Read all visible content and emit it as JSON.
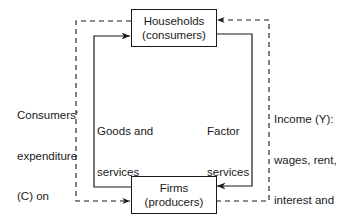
{
  "diagram": {
    "nodes": {
      "households": {
        "line1": "Households",
        "line2": "(consumers)"
      },
      "firms": {
        "line1": "Firms",
        "line2": "(producers)"
      }
    },
    "flows": {
      "goods": {
        "line1": "Goods and",
        "line2": "services",
        "direction": "firms-to-households",
        "style": "solid"
      },
      "factor": {
        "line1": "Factor",
        "line2": "services",
        "direction": "households-to-firms",
        "style": "solid"
      },
      "expenditure": {
        "line1": "Consumers'",
        "line2": "expenditure",
        "line3": "(C) on",
        "line4": "goods and",
        "line5": "services",
        "direction": "households-to-firms",
        "style": "dashed"
      },
      "income": {
        "line1": "Income (Y):",
        "line2": "wages, rent,",
        "line3": "interest and",
        "line4": "profit",
        "direction": "firms-to-households",
        "style": "dashed"
      }
    },
    "colors": {
      "line": "#1a1a1a",
      "background": "#ffffff"
    }
  }
}
